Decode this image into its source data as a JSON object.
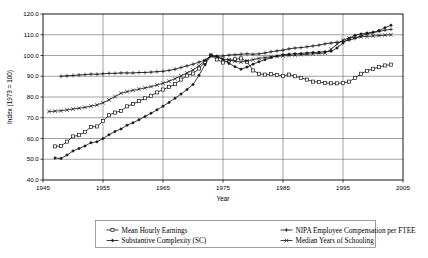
{
  "chart_data": {
    "type": "line",
    "title": "",
    "xlabel": "Year",
    "ylabel": "Index (1973 = 100)",
    "xlim": [
      1945,
      2005
    ],
    "ylim": [
      40.0,
      120.0
    ],
    "grid": true,
    "legend_position": "bottom",
    "x_ticks": [
      "1945",
      "1955",
      "1965",
      "1975",
      "1985",
      "1995",
      "2005"
    ],
    "x_tick_values": [
      1945,
      1955,
      1965,
      1975,
      1985,
      1995,
      2005
    ],
    "y_ticks": [
      "40.0",
      "50.0",
      "60.0",
      "70.0",
      "80.0",
      "90.0",
      "100.0",
      "110.0",
      "120.0"
    ],
    "y_tick_values": [
      40.0,
      50.0,
      60.0,
      70.0,
      80.0,
      90.0,
      100.0,
      110.0,
      120.0
    ],
    "series": [
      {
        "name": "Mean Hourly Earnings",
        "marker": "square",
        "x": [
          1947,
          1948,
          1949,
          1950,
          1951,
          1952,
          1953,
          1954,
          1955,
          1956,
          1957,
          1958,
          1959,
          1960,
          1961,
          1962,
          1963,
          1964,
          1965,
          1966,
          1967,
          1968,
          1969,
          1970,
          1971,
          1972,
          1973,
          1974,
          1975,
          1976,
          1977,
          1978,
          1979,
          1980,
          1981,
          1982,
          1983,
          1984,
          1985,
          1986,
          1987,
          1988,
          1989,
          1990,
          1991,
          1992,
          1993,
          1994,
          1995,
          1996,
          1997,
          1998,
          1999,
          2000,
          2001,
          2002,
          2003
        ],
        "values": [
          56.2,
          56.4,
          58.5,
          61.0,
          61.6,
          63.2,
          65.6,
          65.8,
          68.4,
          71.2,
          72.5,
          73.3,
          75.5,
          76.6,
          78.0,
          79.4,
          80.6,
          82.2,
          83.6,
          84.8,
          86.2,
          88.4,
          90.3,
          91.3,
          93.7,
          96.8,
          100.0,
          98.1,
          96.6,
          97.6,
          98.2,
          98.6,
          97.0,
          92.8,
          91.2,
          90.8,
          91.0,
          90.6,
          90.2,
          90.8,
          90.0,
          89.2,
          88.4,
          87.4,
          87.2,
          86.8,
          86.6,
          86.6,
          86.8,
          87.4,
          89.2,
          91.2,
          92.6,
          93.6,
          94.4,
          95.2,
          95.6
        ]
      },
      {
        "name": "Substantive Complexity (SC)",
        "marker": "diamond",
        "x": [
          1947,
          1948,
          1949,
          1950,
          1951,
          1952,
          1953,
          1954,
          1955,
          1956,
          1957,
          1958,
          1959,
          1960,
          1961,
          1962,
          1963,
          1964,
          1965,
          1966,
          1967,
          1968,
          1969,
          1970,
          1971,
          1972,
          1973,
          1974,
          1975,
          1976,
          1977,
          1978,
          1979,
          1980,
          1981,
          1982,
          1983,
          1984,
          1985,
          1986,
          1987,
          1988,
          1989,
          1990,
          1991,
          1992,
          1993,
          1994,
          1995,
          1996,
          1997,
          1998,
          1999,
          2000,
          2001,
          2002,
          2003
        ],
        "values": [
          50.6,
          50.4,
          52.0,
          54.0,
          55.2,
          56.4,
          58.0,
          58.4,
          60.0,
          61.8,
          63.4,
          64.6,
          66.4,
          67.6,
          69.0,
          70.6,
          72.2,
          73.8,
          75.6,
          77.4,
          79.4,
          81.4,
          83.6,
          86.0,
          90.5,
          95.6,
          100.0,
          99.6,
          98.0,
          96.2,
          94.6,
          93.4,
          94.4,
          95.8,
          97.0,
          98.0,
          99.0,
          99.8,
          100.4,
          100.6,
          100.8,
          101.0,
          101.2,
          101.4,
          101.6,
          101.8,
          102.0,
          103.6,
          106.0,
          108.2,
          109.8,
          110.4,
          110.8,
          111.2,
          112.0,
          113.4,
          114.6
        ]
      },
      {
        "name": "NIPA Employee Compensation per FTEE",
        "marker": "plus",
        "x": [
          1948,
          1949,
          1950,
          1951,
          1952,
          1953,
          1954,
          1955,
          1956,
          1957,
          1958,
          1959,
          1960,
          1961,
          1962,
          1963,
          1964,
          1965,
          1966,
          1967,
          1968,
          1969,
          1970,
          1971,
          1972,
          1973,
          1974,
          1975,
          1976,
          1977,
          1978,
          1979,
          1980,
          1981,
          1982,
          1983,
          1984,
          1985,
          1986,
          1987,
          1988,
          1989,
          1990,
          1991,
          1992,
          1993,
          1994,
          1995,
          1996,
          1997,
          1998,
          1999,
          2000,
          2001,
          2002,
          2003
        ],
        "values": [
          90.0,
          90.2,
          90.4,
          90.6,
          90.8,
          91.0,
          91.0,
          91.2,
          91.4,
          91.4,
          91.6,
          91.6,
          91.6,
          91.8,
          91.8,
          92.0,
          92.2,
          92.4,
          92.8,
          93.4,
          94.2,
          95.0,
          95.8,
          96.8,
          97.8,
          100.0,
          99.6,
          99.8,
          100.2,
          100.4,
          100.6,
          100.8,
          100.6,
          100.8,
          101.2,
          101.8,
          102.2,
          102.6,
          103.2,
          103.6,
          103.8,
          104.2,
          104.6,
          105.0,
          105.6,
          106.0,
          106.4,
          106.8,
          107.4,
          108.2,
          109.4,
          110.4,
          111.0,
          111.6,
          112.2,
          112.6
        ]
      },
      {
        "name": "Median Years of Schooling",
        "marker": "x",
        "x": [
          1946,
          1947,
          1948,
          1949,
          1950,
          1951,
          1952,
          1953,
          1954,
          1955,
          1956,
          1957,
          1958,
          1959,
          1960,
          1961,
          1962,
          1963,
          1964,
          1965,
          1966,
          1967,
          1968,
          1969,
          1970,
          1971,
          1972,
          1973,
          1974,
          1975,
          1976,
          1977,
          1978,
          1979,
          1980,
          1981,
          1982,
          1983,
          1984,
          1985,
          1986,
          1987,
          1988,
          1989,
          1990,
          1991,
          1992,
          1993,
          1994,
          1995,
          1996,
          1997,
          1998,
          1999,
          2000,
          2001,
          2002,
          2003
        ],
        "values": [
          73.0,
          73.2,
          73.4,
          73.8,
          74.2,
          74.6,
          75.0,
          75.6,
          76.2,
          77.2,
          78.6,
          80.2,
          81.8,
          82.6,
          83.2,
          83.8,
          84.4,
          85.0,
          85.8,
          86.6,
          87.6,
          88.8,
          90.2,
          91.6,
          93.0,
          95.0,
          97.4,
          100.0,
          99.2,
          98.4,
          97.8,
          97.2,
          96.8,
          97.4,
          98.0,
          98.6,
          99.0,
          99.4,
          99.6,
          99.8,
          100.0,
          100.2,
          100.4,
          100.6,
          100.8,
          101.0,
          101.2,
          103.0,
          105.4,
          107.4,
          108.4,
          108.8,
          109.0,
          109.2,
          109.4,
          109.6,
          109.8,
          110.0
        ]
      }
    ]
  },
  "legend": {
    "entries": [
      {
        "label": "Mean Hourly Earnings",
        "marker": "square"
      },
      {
        "label": "Substantive Complexity (SC)",
        "marker": "diamond"
      },
      {
        "label": "NIPA Employee Compensation per FTEE",
        "marker": "plus"
      },
      {
        "label": "Median Years of Schooling",
        "marker": "x"
      }
    ]
  }
}
